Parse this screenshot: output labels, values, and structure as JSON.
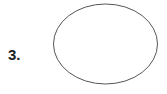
{
  "item": {
    "number_label": "3.",
    "shape": "ellipse",
    "stroke_color": "#555555",
    "fill_color": "#ffffff"
  }
}
